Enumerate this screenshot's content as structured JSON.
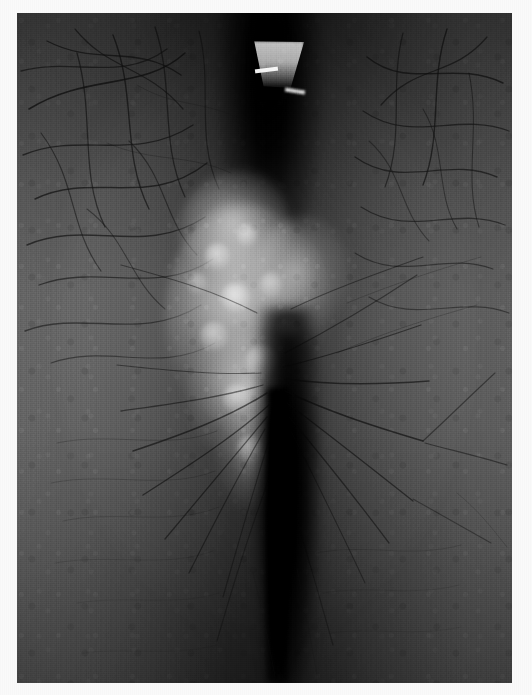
{
  "document": {
    "kind": "clinical-photograph",
    "title": "Clinical photograph",
    "caption": "",
    "width_px": 532,
    "height_px": 695,
    "color_mode": "grayscale"
  },
  "print": {
    "left_px": 17,
    "top_px": 13,
    "width_px": 495,
    "height_px": 670,
    "margin_color": "#fafafa",
    "border_note": "white paper margin on all four sides"
  },
  "palette": {
    "paper_white": "#fafafa",
    "skin_light": "#9a9a9a",
    "skin_mid": "#8a8a8a",
    "skin_shadow": "#5d5d5d",
    "skin_dark": "#3a3a3a",
    "cleft_black": "#0a0a0a",
    "plaque_highlight": "#c8c8c8",
    "specular_white": "#fcfcfc"
  },
  "subject": {
    "description": "Grayscale close-up photograph of hair-bearing skin showing a pale irregular central plaque flanked by a deep dark vertical cleft",
    "orientation": "portrait",
    "regions": [
      {
        "name": "left-skin-field",
        "label": "Left hair-bearing skin",
        "tone": "#909090",
        "texture": "fine reticulated skin markings with curved dark hairs"
      },
      {
        "name": "right-skin-field",
        "label": "Right hair-bearing skin",
        "tone": "#8a8a8a",
        "texture": "fine reticulated skin markings with curved dark hairs"
      },
      {
        "name": "upper-cleft",
        "label": "Upper dark vertical shadow band",
        "tone": "#121212"
      },
      {
        "name": "lower-cleft",
        "label": "Lower deep vertical cleft",
        "tone": "#080808"
      },
      {
        "name": "central-plaque",
        "label": "Pale irregular central plaque",
        "tone": "#bfbfbf"
      },
      {
        "name": "top-specular-patch",
        "label": "Bright trapezoidal specular patch",
        "tone": "#d4d4d4"
      }
    ]
  },
  "plaque_nodules": [
    {
      "left": "26%",
      "top": "20%",
      "w": "11%",
      "h": "9%",
      "alpha": 0.55
    },
    {
      "left": "40%",
      "top": "13%",
      "w": "9%",
      "h": "8%",
      "alpha": 0.5
    },
    {
      "left": "33%",
      "top": "34%",
      "w": "13%",
      "h": "10%",
      "alpha": 0.58
    },
    {
      "left": "50%",
      "top": "30%",
      "w": "10%",
      "h": "9%",
      "alpha": 0.44
    },
    {
      "left": "24%",
      "top": "48%",
      "w": "12%",
      "h": "10%",
      "alpha": 0.5
    },
    {
      "left": "44%",
      "top": "56%",
      "w": "14%",
      "h": "11%",
      "alpha": 0.6
    },
    {
      "left": "34%",
      "top": "70%",
      "w": "12%",
      "h": "10%",
      "alpha": 0.48
    },
    {
      "left": "52%",
      "top": "74%",
      "w": "10%",
      "h": "9%",
      "alpha": 0.42
    },
    {
      "left": "18%",
      "top": "30%",
      "w": "9%",
      "h": "8%",
      "alpha": 0.38
    },
    {
      "left": "58%",
      "top": "46%",
      "w": "9%",
      "h": "8%",
      "alpha": 0.36
    },
    {
      "left": "40%",
      "top": "88%",
      "w": "11%",
      "h": "9%",
      "alpha": 0.4
    }
  ]
}
